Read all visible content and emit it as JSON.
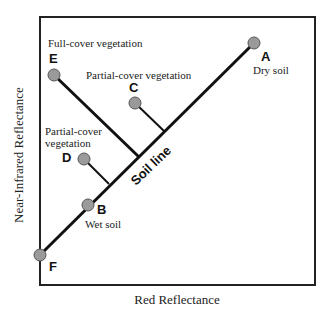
{
  "diagram": {
    "axes": {
      "x_label": "Red Reflectance",
      "y_label": "Near-Infrared Reflectance"
    },
    "soil_line": {
      "label": "Soil line",
      "from_point": "F",
      "to_point": "A"
    },
    "points": [
      {
        "id": "A",
        "letter": "A",
        "description": "Dry soil",
        "on_soil_line": true
      },
      {
        "id": "B",
        "letter": "B",
        "description": "Wet soil",
        "on_soil_line": true
      },
      {
        "id": "C",
        "letter": "C",
        "description": "Partial-cover vegetation",
        "on_soil_line": false
      },
      {
        "id": "D",
        "letter": "D",
        "description_line1": "Partial-cover",
        "description_line2": "vegetation",
        "on_soil_line": false
      },
      {
        "id": "E",
        "letter": "E",
        "description": "Full-cover vegetation",
        "on_soil_line": false
      },
      {
        "id": "F",
        "letter": "F",
        "description": "",
        "on_soil_line": true
      }
    ],
    "colors": {
      "point_fill": "#9a9a9a",
      "point_stroke": "#555555",
      "line": "#111111",
      "frame": "#222222"
    }
  }
}
